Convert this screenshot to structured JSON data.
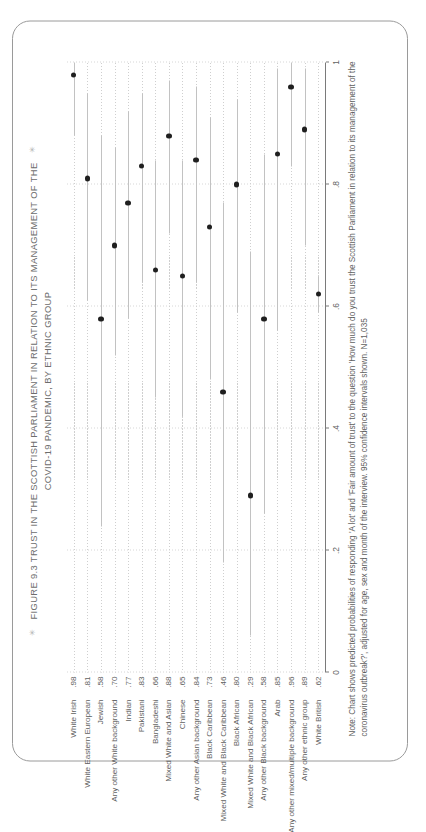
{
  "figure": {
    "title_line1": "FIGURE 9.3  TRUST IN THE SCOTTISH PARLIAMENT IN RELATION TO ITS MANAGEMENT OF THE",
    "title_line2": "COVID-19 PANDEMIC, BY ETHNIC GROUP",
    "deco_left": "✳",
    "deco_right": "✳",
    "note": "Note: Chart shows predicted probabilities of responding 'A lot' and 'Fair amount of trust' to the question 'How much do you trust the Scottish Parliament in relation to its management of the coronavirus outbreak?', adjusted for age, sex and month of the interview. 95% confidence intervals shown. N=1,035"
  },
  "chart_data": {
    "type": "scatter",
    "title": "FIGURE 9.3  TRUST IN THE SCOTTISH PARLIAMENT IN RELATION TO ITS MANAGEMENT OF THE COVID-19 PANDEMIC, BY ETHNIC GROUP",
    "xlabel": "",
    "ylabel": "",
    "xlim": [
      0,
      1
    ],
    "ticks": [
      "0",
      ".2",
      ".4",
      ".6",
      ".8",
      "1"
    ],
    "tick_values": [
      0,
      0.2,
      0.4,
      0.6,
      0.8,
      1
    ],
    "grid": true,
    "legend": "none",
    "error_bars": "95% confidence intervals",
    "categories": [
      "White Irish",
      "White Eastern European",
      "Jewish",
      "Any other White background",
      "Indian",
      "Pakistani",
      "Bangladeshi",
      "Mixed White and Asian",
      "Chinese",
      "Any other Asian background",
      "Black Caribbean",
      "Mixed White and Black Caribbean",
      "Black African",
      "Mixed White and Black African",
      "Any other Black background",
      "Arab",
      "Any other mixed/multiple background",
      "Any other ethnic group",
      "White British"
    ],
    "values": [
      0.98,
      0.81,
      0.58,
      0.7,
      0.77,
      0.83,
      0.66,
      0.88,
      0.65,
      0.84,
      0.73,
      0.46,
      0.8,
      0.29,
      0.58,
      0.85,
      0.96,
      0.89,
      0.62
    ],
    "value_labels": [
      ".98",
      ".81",
      ".58",
      ".70",
      ".77",
      ".83",
      ".66",
      ".88",
      ".65",
      ".84",
      ".73",
      ".46",
      ".80",
      ".29",
      ".58",
      ".85",
      ".96",
      ".89",
      ".62"
    ],
    "ci_low": [
      0.88,
      0.61,
      0.24,
      0.52,
      0.58,
      0.64,
      0.45,
      0.72,
      0.42,
      0.64,
      0.48,
      0.18,
      0.59,
      0.06,
      0.26,
      0.56,
      0.83,
      0.7,
      0.59
    ],
    "ci_high": [
      1.0,
      0.95,
      0.88,
      0.86,
      0.92,
      0.95,
      0.84,
      0.97,
      0.84,
      0.96,
      0.91,
      0.77,
      0.94,
      0.69,
      0.85,
      0.99,
      1.0,
      0.99,
      0.65
    ]
  }
}
